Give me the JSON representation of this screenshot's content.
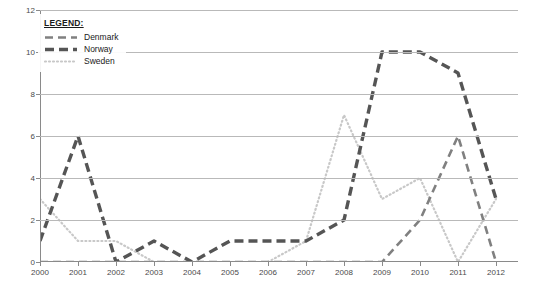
{
  "legend": {
    "title": "LEGEND:",
    "entries": [
      {
        "label": "Denmark",
        "color": "#808080",
        "style": "dashed"
      },
      {
        "label": "Norway",
        "color": "#555555",
        "style": "dashed-thick"
      },
      {
        "label": "Sweden",
        "color": "#c8c8c8",
        "style": "dotted"
      }
    ]
  },
  "chart_data": {
    "type": "line",
    "title": "",
    "xlabel": "",
    "ylabel": "",
    "x": [
      2000,
      2001,
      2002,
      2003,
      2004,
      2005,
      2006,
      2007,
      2008,
      2009,
      2010,
      2011,
      2012
    ],
    "categories": [
      "2000",
      "2001",
      "2002",
      "2003",
      "2004",
      "2005",
      "2006",
      "2007",
      "2008",
      "2009",
      "2010",
      "2011",
      "2012"
    ],
    "xlim": [
      2000,
      2012
    ],
    "ylim": [
      0,
      12
    ],
    "yticks": [
      0,
      2,
      4,
      6,
      8,
      10,
      12
    ],
    "ytick_labels": [
      "0",
      "2",
      "4",
      "6",
      "8",
      "10",
      "12"
    ],
    "grid": true,
    "legend_position": "top-left",
    "series": [
      {
        "name": "Denmark",
        "color": "#808080",
        "values": [
          0,
          0,
          0,
          0,
          0,
          0,
          0,
          0,
          0,
          0,
          2,
          6,
          0
        ]
      },
      {
        "name": "Norway",
        "color": "#555555",
        "values": [
          1,
          6,
          0,
          1,
          0,
          1,
          1,
          1,
          2,
          10,
          10,
          9,
          3
        ]
      },
      {
        "name": "Sweden",
        "color": "#c8c8c8",
        "values": [
          3,
          1,
          1,
          0,
          0,
          0,
          0,
          1,
          7,
          3,
          4,
          0,
          3
        ]
      }
    ]
  }
}
